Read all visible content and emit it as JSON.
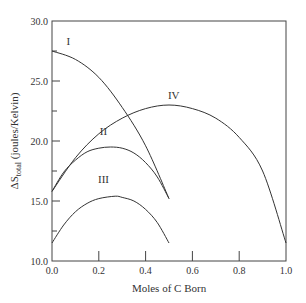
{
  "chart_data": {
    "type": "line",
    "title": "",
    "xlabel": "Moles of C Born",
    "ylabel": "ΔS_total (joules/Kelvin)",
    "ylabel_main": "ΔS",
    "ylabel_sub": "total",
    "ylabel_rest": " (joules/Kelvin)",
    "xlim": [
      0.0,
      1.0
    ],
    "ylim": [
      10.0,
      30.0
    ],
    "grid": false,
    "legend": "none (curves labeled inline)",
    "x_ticks": [
      "0.0",
      "0.2",
      "0.4",
      "0.6",
      "0.8",
      "1.0"
    ],
    "y_ticks": [
      "10.0",
      "15.0",
      "20.0",
      "25.0",
      "30.0"
    ],
    "series": [
      {
        "name": "I",
        "x": [
          0.0,
          0.1,
          0.2,
          0.3,
          0.4,
          0.5
        ],
        "values": [
          27.5,
          26.8,
          25.3,
          22.8,
          19.6,
          15.2
        ]
      },
      {
        "name": "II",
        "x": [
          0.0,
          0.05,
          0.1,
          0.15,
          0.2,
          0.25,
          0.3,
          0.35,
          0.4,
          0.45,
          0.5
        ],
        "values": [
          15.8,
          17.4,
          18.4,
          19.1,
          19.4,
          19.5,
          19.4,
          19.0,
          18.2,
          17.0,
          15.2
        ]
      },
      {
        "name": "III",
        "x": [
          0.0,
          0.05,
          0.1,
          0.15,
          0.2,
          0.27,
          0.3,
          0.35,
          0.4,
          0.45,
          0.5
        ],
        "values": [
          11.5,
          13.0,
          14.1,
          14.8,
          15.2,
          15.4,
          15.3,
          15.0,
          14.3,
          13.2,
          11.5
        ]
      },
      {
        "name": "IV",
        "x": [
          0.0,
          0.1,
          0.2,
          0.3,
          0.4,
          0.5,
          0.6,
          0.7,
          0.8,
          0.9,
          1.0
        ],
        "values": [
          15.8,
          18.6,
          20.6,
          21.9,
          22.7,
          23.0,
          22.7,
          21.9,
          20.3,
          17.5,
          11.5
        ]
      }
    ],
    "annotations": [
      {
        "text": "I",
        "x": 0.07,
        "y": 28.0
      },
      {
        "text": "II",
        "x": 0.22,
        "y": 20.5
      },
      {
        "text": "III",
        "x": 0.22,
        "y": 16.5
      },
      {
        "text": "IV",
        "x": 0.52,
        "y": 23.5
      }
    ]
  }
}
